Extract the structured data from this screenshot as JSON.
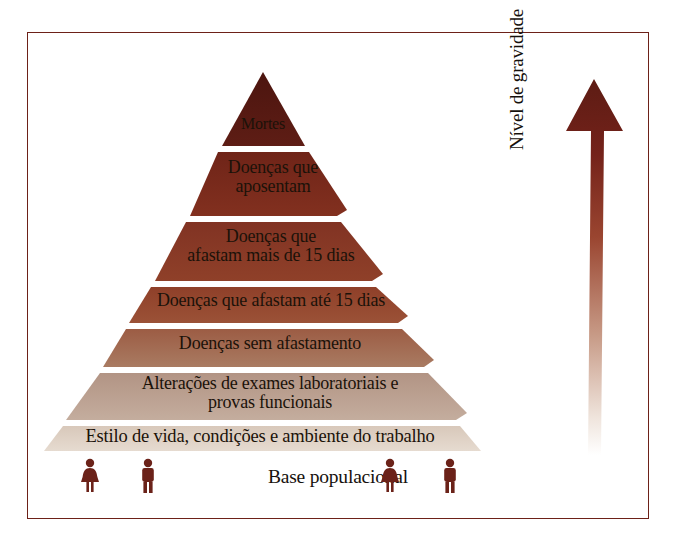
{
  "figure": {
    "frame_color": "#6d2118",
    "background": "#ffffff"
  },
  "pyramid": {
    "apex_label": "Mortes",
    "layers": [
      {
        "label": "Mortes",
        "color": "#561a13",
        "level": 7
      },
      {
        "label": "Doenças que\naposentam",
        "color": "#7a2a1c",
        "level": 6
      },
      {
        "label": "Doenças que\nafastam mais de 15 dias",
        "color": "#8a3a26",
        "level": 5
      },
      {
        "label": "Doenças que afastam até 15 dias",
        "color": "#96452d",
        "level": 4
      },
      {
        "label": "Doenças sem afastamento",
        "color": "#a2604a",
        "level": 3
      },
      {
        "label": "Alterações de exames laboratoriais e\nprovas funcionais",
        "color": "#b79c8c",
        "level": 2
      },
      {
        "label": "Estilo de vida, condições e ambiente do trabalho",
        "color": "#ded0c3",
        "level": 1
      }
    ],
    "divider_color": "#ffffff"
  },
  "arrow": {
    "label": "Nível de gravidade",
    "direction": "up",
    "tip_color": "#5d1c14",
    "tail_color": "#f3ece7"
  },
  "base": {
    "caption": "Base populacional",
    "figure_color": "#6b2219",
    "figures": [
      {
        "gender": "female",
        "x": 52
      },
      {
        "gender": "male",
        "x": 110
      },
      {
        "gender": "female",
        "x": 352
      },
      {
        "gender": "male",
        "x": 412
      }
    ]
  }
}
